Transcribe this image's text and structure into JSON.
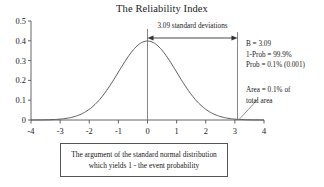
{
  "chart_data": {
    "type": "line",
    "title": "The Reliability Index",
    "xlabel": "",
    "ylabel": "",
    "xlim": [
      -4,
      4
    ],
    "ylim": [
      0,
      0.5
    ],
    "grid": false,
    "legend": "none",
    "x_ticks": [
      "-4",
      "-3",
      "-2",
      "-1",
      "0",
      "1",
      "2",
      "3",
      "4"
    ],
    "x_tick_values": [
      -4,
      -3,
      -2,
      -1,
      0,
      1,
      2,
      3,
      4
    ],
    "y_ticks": [
      "0",
      "0.1",
      "0.2",
      "0.3",
      "0.4",
      "0.5"
    ],
    "y_tick_values": [
      0,
      0.1,
      0.2,
      0.3,
      0.4,
      0.5
    ],
    "series": [
      {
        "name": "standard normal density",
        "x": [
          -4,
          -3.75,
          -3.5,
          -3.25,
          -3,
          -2.75,
          -2.5,
          -2.25,
          -2,
          -1.75,
          -1.5,
          -1.25,
          -1,
          -0.75,
          -0.5,
          -0.25,
          0,
          0.25,
          0.5,
          0.75,
          1,
          1.25,
          1.5,
          1.75,
          2,
          2.25,
          2.5,
          2.75,
          3,
          3.25,
          3.5,
          3.75,
          4
        ],
        "values": [
          0.0001,
          0.0004,
          0.0009,
          0.002,
          0.0044,
          0.0091,
          0.0175,
          0.0317,
          0.054,
          0.0863,
          0.1295,
          0.1826,
          0.242,
          0.3011,
          0.3521,
          0.3867,
          0.3989,
          0.3867,
          0.3521,
          0.3011,
          0.242,
          0.1826,
          0.1295,
          0.0863,
          0.054,
          0.0317,
          0.0175,
          0.0091,
          0.0044,
          0.002,
          0.0009,
          0.0004,
          0.0001
        ]
      }
    ],
    "markers": [
      {
        "name": "center-line",
        "x": 0,
        "label": ""
      },
      {
        "name": "beta-line",
        "x": 3.09,
        "label": ""
      }
    ],
    "annotations": {
      "span_arrow_label": "3.09 standard deviations",
      "span_from": 0,
      "span_to": 3.09,
      "stats": [
        "B = 3.09",
        "1-Prob = 99.9%",
        "Prob = 0.1% (0.001)"
      ],
      "area_note": [
        "Area = 0.1% of",
        "total area"
      ],
      "caption": [
        "The argument of the standard normal distribution",
        "which yields 1 - the event probability"
      ]
    },
    "colors": {
      "curve": "#4a4a4a",
      "axis": "#555555",
      "marker_line": "#666666",
      "text": "#1a1a1a",
      "background": "#ffffff"
    }
  }
}
